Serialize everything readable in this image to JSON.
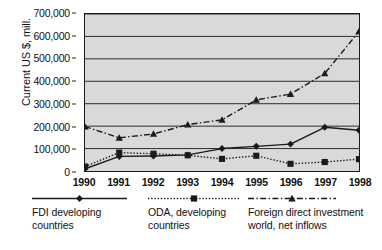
{
  "chart_data": {
    "type": "line",
    "title": "",
    "xlabel": "",
    "ylabel": "Current US $, mill.",
    "x": [
      "1990",
      "1991",
      "1992",
      "1993",
      "1994",
      "1995",
      "1996",
      "1997",
      "1998"
    ],
    "categories": [
      "1990",
      "1991",
      "1992",
      "1993",
      "1994",
      "1995",
      "1996",
      "1997",
      "1998"
    ],
    "ylim": [
      0,
      700000
    ],
    "ytick_values": [
      0,
      100000,
      200000,
      300000,
      400000,
      500000,
      600000,
      700000
    ],
    "ytick_labels": [
      "0",
      "100,000",
      "200,000",
      "300,000",
      "400,000",
      "500,000",
      "600,000",
      "700,000"
    ],
    "grid": true,
    "grid_axis": "y",
    "legend_position": "bottom",
    "plot_background": "#d9d9d9",
    "series": [
      {
        "name": "FDI developing countries",
        "legend_label_line1": "FDI developing",
        "legend_label_line2": "countries",
        "marker": "diamond",
        "linestyle": "solid",
        "color": "#1a1a1a",
        "values": [
          10000,
          65000,
          67000,
          72000,
          100000,
          110000,
          120000,
          195000,
          182000
        ]
      },
      {
        "name": "ODA, developing countries",
        "legend_label_line1": "ODA, developing",
        "legend_label_line2": "countries",
        "marker": "square",
        "linestyle": "dotted",
        "color": "#1a1a1a",
        "values": [
          20000,
          82000,
          77000,
          70000,
          54000,
          68000,
          32000,
          40000,
          53000
        ]
      },
      {
        "name": "Foreign direct investment world, net inflows",
        "legend_label_line1": "Foreign direct investment",
        "legend_label_line2": "world, net inflows",
        "marker": "triangle",
        "linestyle": "dashdot",
        "color": "#1a1a1a",
        "values": [
          198000,
          148000,
          165000,
          207000,
          228000,
          317000,
          343000,
          435000,
          622000
        ]
      }
    ]
  }
}
